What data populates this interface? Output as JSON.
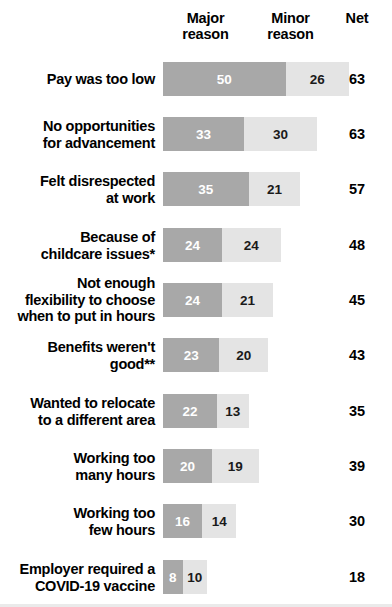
{
  "header": {
    "major_line1": "Major",
    "major_line2": "reason",
    "minor_line1": "Minor",
    "minor_line2": "reason",
    "net": "Net"
  },
  "colors": {
    "major": "#a8a8a8",
    "minor": "#e4e4e4",
    "background": "#ffffff",
    "text": "#000000",
    "major_value_text": "#ffffff"
  },
  "chart_data": {
    "type": "bar",
    "title": "",
    "subtitle": "",
    "xlabel": "",
    "ylabel": "",
    "grid": false,
    "stacked": true,
    "orientation": "horizontal",
    "legend_position": "top",
    "value_unit": "%",
    "categories": [
      "Pay was too low",
      "No opportunities\nfor advancement",
      "Felt disrespected\nat work",
      "Because of\nchildcare issues*",
      "Not enough\nflexibility to choose\nwhen to put in hours",
      "Benefits weren't\ngood**",
      "Wanted to relocate\nto a different area",
      "Working too\nmany hours",
      "Working too\nfew hours",
      "Employer required a\nCOVID-19 vaccine"
    ],
    "series": [
      {
        "name": "Major reason",
        "values": [
          50,
          33,
          35,
          24,
          24,
          23,
          22,
          20,
          16,
          8
        ]
      },
      {
        "name": "Minor reason",
        "values": [
          26,
          30,
          21,
          24,
          21,
          20,
          13,
          19,
          14,
          10
        ]
      }
    ],
    "net": {
      "name": "Net",
      "values": [
        63,
        63,
        57,
        48,
        45,
        43,
        35,
        39,
        30,
        18
      ]
    }
  },
  "rows": [
    {
      "label": "Pay was too low",
      "major": "50",
      "minor": "26",
      "net": "63"
    },
    {
      "label": "No opportunities\nfor advancement",
      "major": "33",
      "minor": "30",
      "net": "63"
    },
    {
      "label": "Felt disrespected\nat work",
      "major": "35",
      "minor": "21",
      "net": "57"
    },
    {
      "label": "Because of\nchildcare issues*",
      "major": "24",
      "minor": "24",
      "net": "48"
    },
    {
      "label": "Not enough\nflexibility to choose\nwhen to put in hours",
      "major": "24",
      "minor": "21",
      "net": "45"
    },
    {
      "label": "Benefits weren't\ngood**",
      "major": "23",
      "minor": "20",
      "net": "43"
    },
    {
      "label": "Wanted to relocate\nto a different area",
      "major": "22",
      "minor": "13",
      "net": "35"
    },
    {
      "label": "Working too\nmany hours",
      "major": "20",
      "minor": "19",
      "net": "39"
    },
    {
      "label": "Working too\nfew hours",
      "major": "16",
      "minor": "14",
      "net": "30"
    },
    {
      "label": "Employer required a\nCOVID-19 vaccine",
      "major": "8",
      "minor": "10",
      "net": "18"
    }
  ],
  "layout": {
    "bar_left_px": 163,
    "px_per_unit": 2.45,
    "bar_height_px": 34,
    "row_tops_px": [
      62,
      117,
      172,
      228,
      283,
      338,
      394,
      449,
      504,
      560
    ]
  }
}
